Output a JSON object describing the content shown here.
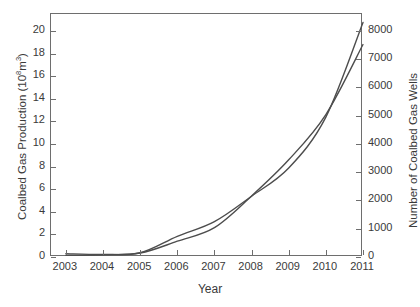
{
  "chart_data": {
    "type": "line",
    "title": "",
    "xlabel": "Year",
    "ylabel": "Coalbed Gas Production (10⁸m³)",
    "ylabel_right": "Number of Coalbed Gas Wells",
    "grid": false,
    "legend": "none",
    "x": [
      2003,
      2004,
      2005,
      2006,
      2007,
      2008,
      2009,
      2010,
      2011
    ],
    "xlim": [
      2002.6,
      2011.0
    ],
    "xticks": [
      "2003",
      "2004",
      "2005",
      "2006",
      "2007",
      "2008",
      "2009",
      "2010",
      "2011"
    ],
    "ylim": [
      0,
      21.5
    ],
    "yticks": [
      "0",
      "2",
      "4",
      "6",
      "8",
      "10",
      "12",
      "14",
      "16",
      "18",
      "20"
    ],
    "ylim_right": [
      0,
      8600
    ],
    "yticks_right": [
      "0",
      "1000",
      "2000",
      "3000",
      "4000",
      "5000",
      "6000",
      "7000",
      "8000"
    ],
    "series": [
      {
        "name": "Coalbed Gas Production",
        "axis": "left",
        "units": "10^8 m^3",
        "color": "#4d4d4d",
        "values": [
          0.15,
          0.2,
          0.35,
          1.4,
          2.6,
          5.4,
          8.6,
          12.6,
          18.8
        ]
      },
      {
        "name": "Number of Coalbed Gas Wells",
        "axis": "right",
        "units": "wells",
        "color": "#4d4d4d",
        "values": [
          120,
          90,
          150,
          730,
          1250,
          2150,
          3150,
          4950,
          8300
        ]
      }
    ]
  },
  "watermark": {
    "line1": "",
    "line2": ""
  }
}
